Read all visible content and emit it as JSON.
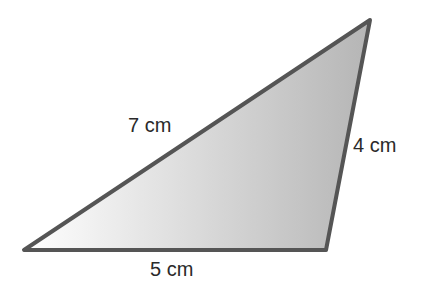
{
  "diagram": {
    "type": "triangle",
    "vertices": {
      "left": [
        24,
        250
      ],
      "bottom_right": [
        326,
        250
      ],
      "top": [
        370,
        20
      ]
    },
    "fill": {
      "from": "#ffffff",
      "to": "#b8b8b8"
    },
    "stroke": "#555555",
    "sides": {
      "left_hypotenuse": "7 cm",
      "right_side": "4 cm",
      "bottom": "5 cm"
    }
  }
}
